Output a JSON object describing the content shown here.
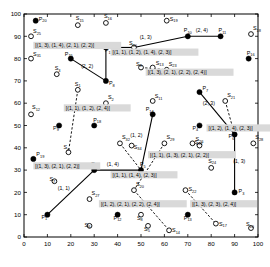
{
  "chart_data": {
    "type": "scatter",
    "title": "",
    "xlabel": "",
    "ylabel": "",
    "xlim": [
      0,
      100
    ],
    "ylim": [
      0,
      100
    ],
    "grid": false,
    "legend": null,
    "xticks": [
      0,
      10,
      20,
      30,
      40,
      50,
      60,
      70,
      80,
      90,
      100
    ],
    "yticks": [
      0,
      10,
      20,
      30,
      40,
      50,
      60,
      70,
      80,
      90,
      100
    ],
    "xtick_labels": [
      "0",
      "10",
      "20",
      "30",
      "40",
      "50",
      "60",
      "70",
      "80",
      "90",
      "100"
    ],
    "ytick_labels": [
      "0",
      "10",
      "20",
      "30",
      "40",
      "50",
      "60",
      "70",
      "80",
      "90",
      "100"
    ],
    "series": [
      {
        "name": "P",
        "marker": "filled-circle",
        "points": [
          {
            "id": "P1",
            "label": "P",
            "sub": "1",
            "x": 10,
            "y": 10,
            "lx": -6,
            "ly": 4
          },
          {
            "id": "P2",
            "label": "P",
            "sub": "2",
            "x": 30,
            "y": 30,
            "lx": -3,
            "ly": -4
          },
          {
            "id": "P3",
            "label": "P",
            "sub": "3",
            "x": 90,
            "y": 20,
            "lx": 4,
            "ly": 1
          },
          {
            "id": "P4",
            "label": "P",
            "sub": "4",
            "x": 75,
            "y": 50,
            "lx": -7,
            "ly": 4
          },
          {
            "id": "P5",
            "label": "P",
            "sub": "5",
            "x": 50,
            "y": 30,
            "lx": -1,
            "ly": -4
          },
          {
            "id": "P6",
            "label": "P",
            "sub": "6",
            "x": 90,
            "y": 46,
            "lx": -6,
            "ly": 4
          },
          {
            "id": "P7",
            "label": "P",
            "sub": "7",
            "x": 75,
            "y": 65,
            "lx": 3,
            "ly": -2
          },
          {
            "id": "P8",
            "label": "P",
            "sub": "8",
            "x": 35,
            "y": 70,
            "lx": 3,
            "ly": 4
          },
          {
            "id": "P9",
            "label": "P",
            "sub": "9",
            "x": 15,
            "y": 50,
            "lx": -6,
            "ly": 4
          },
          {
            "id": "P10",
            "label": "P",
            "sub": "10",
            "x": 70,
            "y": 90,
            "lx": -4,
            "ly": -4
          },
          {
            "id": "P11",
            "label": "P",
            "sub": "11",
            "x": 84,
            "y": 90,
            "lx": -2,
            "ly": -4
          },
          {
            "id": "P12",
            "label": "P",
            "sub": "12",
            "x": 40,
            "y": 10,
            "lx": -4,
            "ly": 5
          },
          {
            "id": "P13",
            "label": "P",
            "sub": "13",
            "x": 70,
            "y": 10,
            "lx": -4,
            "ly": 5
          },
          {
            "id": "P14",
            "label": "P",
            "sub": "14",
            "x": 55,
            "y": 55,
            "lx": -7,
            "ly": -3
          },
          {
            "id": "P15",
            "label": "P",
            "sub": "15",
            "x": 20,
            "y": 80,
            "lx": -6,
            "ly": -3
          },
          {
            "id": "P16",
            "label": "P",
            "sub": "16",
            "x": 96,
            "y": 80,
            "lx": -2,
            "ly": -4
          },
          {
            "id": "P17",
            "label": "P",
            "sub": "17",
            "x": 35,
            "y": 85,
            "lx": -1,
            "ly": 5
          },
          {
            "id": "P18",
            "label": "P",
            "sub": "18",
            "x": 30,
            "y": 50,
            "lx": -1,
            "ly": -4
          },
          {
            "id": "P19",
            "label": "P",
            "sub": "19",
            "x": 4,
            "y": 35,
            "lx": 3,
            "ly": -3
          },
          {
            "id": "P20",
            "label": "P",
            "sub": "20",
            "x": 5,
            "y": 97,
            "lx": 3,
            "ly": 0
          }
        ]
      },
      {
        "name": "S",
        "marker": "open-circle",
        "points": [
          {
            "id": "S1",
            "label": "S",
            "sub": "1",
            "x": 23,
            "y": 66,
            "lx": -3,
            "ly": -4
          },
          {
            "id": "S2",
            "label": "S",
            "sub": "2",
            "x": 35,
            "y": 60,
            "lx": 2,
            "ly": -4
          },
          {
            "id": "S3",
            "label": "S",
            "sub": "3",
            "x": 14,
            "y": 73,
            "lx": -2,
            "ly": -4
          },
          {
            "id": "S4",
            "label": "S",
            "sub": "4",
            "x": 19,
            "y": 38,
            "lx": -5,
            "ly": -3
          },
          {
            "id": "S5",
            "label": "S",
            "sub": "5",
            "x": 53,
            "y": 5,
            "lx": -4,
            "ly": 5
          },
          {
            "id": "S6",
            "label": "S",
            "sub": "6",
            "x": 28,
            "y": 5,
            "lx": -5,
            "ly": 1
          },
          {
            "id": "S7",
            "label": "S",
            "sub": "7",
            "x": 13,
            "y": 25,
            "lx": -5,
            "ly": 0
          },
          {
            "id": "S8",
            "label": "S",
            "sub": "8",
            "x": 50,
            "y": 10,
            "lx": -4,
            "ly": 5
          },
          {
            "id": "S9",
            "label": "S",
            "sub": "9",
            "x": 50,
            "y": 76,
            "lx": -5,
            "ly": -2
          },
          {
            "id": "S10",
            "label": "S",
            "sub": "10",
            "x": 97,
            "y": 4,
            "lx": -5,
            "ly": -2
          },
          {
            "id": "S11",
            "label": "S",
            "sub": "11",
            "x": 55,
            "y": 61,
            "lx": 2,
            "ly": -3
          },
          {
            "id": "S12",
            "label": "S",
            "sub": "12",
            "x": 3,
            "y": 55,
            "lx": 1,
            "ly": -5
          },
          {
            "id": "S13",
            "label": "S",
            "sub": "13",
            "x": 55,
            "y": 76,
            "lx": 3,
            "ly": -3
          },
          {
            "id": "S14",
            "label": "S",
            "sub": "14",
            "x": 62,
            "y": 3,
            "lx": 3,
            "ly": 2
          },
          {
            "id": "S15",
            "label": "S",
            "sub": "15",
            "x": 23,
            "y": 95,
            "lx": -2,
            "ly": -5
          },
          {
            "id": "S16",
            "label": "S",
            "sub": "16",
            "x": 35,
            "y": 96,
            "lx": -2,
            "ly": -5
          },
          {
            "id": "S17",
            "label": "S",
            "sub": "17",
            "x": 82,
            "y": 6,
            "lx": 3,
            "ly": 2
          },
          {
            "id": "S18",
            "label": "S",
            "sub": "18",
            "x": 97,
            "y": 91,
            "lx": 2,
            "ly": -4
          },
          {
            "id": "S19",
            "label": "S",
            "sub": "19",
            "x": 61,
            "y": 97,
            "lx": 3,
            "ly": 0
          },
          {
            "id": "S20",
            "label": "S",
            "sub": "20",
            "x": 47,
            "y": 21,
            "lx": 2,
            "ly": -4
          },
          {
            "id": "S21",
            "label": "S",
            "sub": "21",
            "x": 86,
            "y": 61,
            "lx": 2,
            "ly": -4
          },
          {
            "id": "S22",
            "label": "S",
            "sub": "22",
            "x": 69,
            "y": 21,
            "lx": 3,
            "ly": 1
          },
          {
            "id": "S23",
            "label": "S",
            "sub": "23",
            "x": 61,
            "y": 75,
            "lx": 2,
            "ly": -4
          },
          {
            "id": "S24",
            "label": "S",
            "sub": "24",
            "x": 80,
            "y": 31,
            "lx": -3,
            "ly": -5
          },
          {
            "id": "S25",
            "label": "S",
            "sub": "25",
            "x": 3,
            "y": 90,
            "lx": 2,
            "ly": -3
          },
          {
            "id": "S26",
            "label": "S",
            "sub": "26",
            "x": 72,
            "y": 42,
            "lx": 3,
            "ly": -2
          },
          {
            "id": "S27",
            "label": "S",
            "sub": "27",
            "x": 28,
            "y": 17,
            "lx": 2,
            "ly": -4
          },
          {
            "id": "S28",
            "label": "S",
            "sub": "28",
            "x": 98,
            "y": 42,
            "lx": 2,
            "ly": -4
          },
          {
            "id": "S29",
            "label": "S",
            "sub": "29",
            "x": 60,
            "y": 42,
            "lx": 2,
            "ly": -4
          },
          {
            "id": "S30",
            "label": "S",
            "sub": "30",
            "x": 47,
            "y": 85,
            "lx": -5,
            "ly": -2
          },
          {
            "id": "S31",
            "label": "S",
            "sub": "31",
            "x": 3,
            "y": 80,
            "lx": 2,
            "ly": -3
          },
          {
            "id": "S32",
            "label": "S",
            "sub": "32",
            "x": 41,
            "y": 42,
            "lx": 2,
            "ly": -4
          },
          {
            "id": "S33",
            "label": "S",
            "sub": "33",
            "x": 75,
            "y": 41,
            "lx": -5,
            "ly": -2
          },
          {
            "id": "S34",
            "label": "S",
            "sub": "34",
            "x": 46,
            "y": 41,
            "lx": 2,
            "ly": 3
          }
        ]
      }
    ],
    "edges_solid": [
      {
        "from": "P1",
        "to": "P2",
        "label": "(1, 1)",
        "lx": 17,
        "ly": 21
      },
      {
        "from": "P2",
        "to": "P5",
        "label": "(1, 4)",
        "lx": 38,
        "ly": 32
      },
      {
        "from": "P5",
        "to": "P14",
        "label": "(1, 2)",
        "lx": 48,
        "ly": 45
      },
      {
        "from": "P15",
        "to": "P8",
        "label": "(2, 2)",
        "lx": 27,
        "ly": 76
      },
      {
        "from": "P8",
        "to": "P17",
        "label": "",
        "lx": 0,
        "ly": 0
      },
      {
        "from": "P17",
        "to": "S30",
        "label": "",
        "lx": 0,
        "ly": 0
      },
      {
        "from": "S30",
        "to": "P10",
        "label": "(1, 3)",
        "lx": 52,
        "ly": 89
      },
      {
        "from": "P10",
        "to": "P11",
        "label": "(2, 4)",
        "lx": 76,
        "ly": 92
      },
      {
        "from": "P7",
        "to": "P6",
        "label": "(2, 3)",
        "lx": 79,
        "ly": 59
      },
      {
        "from": "P6",
        "to": "P3",
        "label": "(1, 3)",
        "lx": 92,
        "ly": 33
      }
    ],
    "edges_dash": [
      {
        "from": "S1",
        "to": "S4",
        "label": ""
      },
      {
        "from": "S9",
        "to": "S23",
        "label": ""
      },
      {
        "from": "S21",
        "to": "P6",
        "label": ""
      },
      {
        "from": "S26",
        "to": "S33",
        "label": ""
      },
      {
        "from": "S29",
        "to": "S20",
        "label": ""
      },
      {
        "from": "S22",
        "to": "S17",
        "label": ""
      },
      {
        "from": "S20",
        "to": "S14",
        "label": ""
      },
      {
        "from": "S32",
        "to": "P5",
        "label": ""
      },
      {
        "from": "S15",
        "to": "S15b",
        "label": ""
      }
    ],
    "box_labels": [
      {
        "text": "[(1, 3), (1, 4), (2, 1), (2, 2)]",
        "x": 4,
        "y": 85
      },
      {
        "text": "[(1, 1), (1, 2), (1, 4), (2, 3)]",
        "x": 37,
        "y": 82
      },
      {
        "text": "[(1, 3), (2, 1), (2, 2), (2, 4)]",
        "x": 52,
        "y": 73
      },
      {
        "text": "[(1, 1), (1, 2), (2, 4)]",
        "x": 17,
        "y": 57
      },
      {
        "text": "[(1, 2), (1, 4), (2, 3)]",
        "x": 78,
        "y": 48
      },
      {
        "text": "[(1, 1), (1, 3), (2, 1), (2, 2)]",
        "x": 53,
        "y": 36
      },
      {
        "text": "[(1, 3), (2, 1), (2, 2)]",
        "x": 4,
        "y": 31
      },
      {
        "text": "[(1, 1), (1, 4), (2, 3)]",
        "x": 37,
        "y": 27
      },
      {
        "text": "[(1, 2), (2, 1), (2, 2), (2, 4)]",
        "x": 32,
        "y": 14
      },
      {
        "text": "[(1, 3), (2, 3), (2, 4)]",
        "x": 71,
        "y": 14
      }
    ]
  }
}
